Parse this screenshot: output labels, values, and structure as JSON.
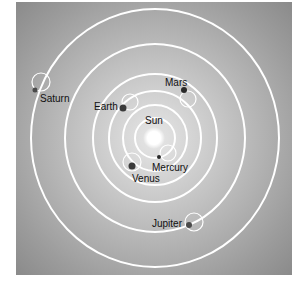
{
  "diagram": {
    "colors": {
      "background_center": "#e4e4e4",
      "background_edge": "#8e8e8e",
      "orbit": "#ffffff",
      "planet": "#3a3a3a",
      "sun": "#ffffff",
      "label": "#111111"
    },
    "sun": {
      "label": "Sun"
    },
    "planets": [
      {
        "id": "mercury",
        "label": "Mercury",
        "orbit_index": 0
      },
      {
        "id": "venus",
        "label": "Venus",
        "orbit_index": 1
      },
      {
        "id": "earth",
        "label": "Earth",
        "orbit_index": 2
      },
      {
        "id": "mars",
        "label": "Mars",
        "orbit_index": 3
      },
      {
        "id": "jupiter",
        "label": "Jupiter",
        "orbit_index": 4
      },
      {
        "id": "saturn",
        "label": "Saturn",
        "orbit_index": 5
      }
    ]
  }
}
